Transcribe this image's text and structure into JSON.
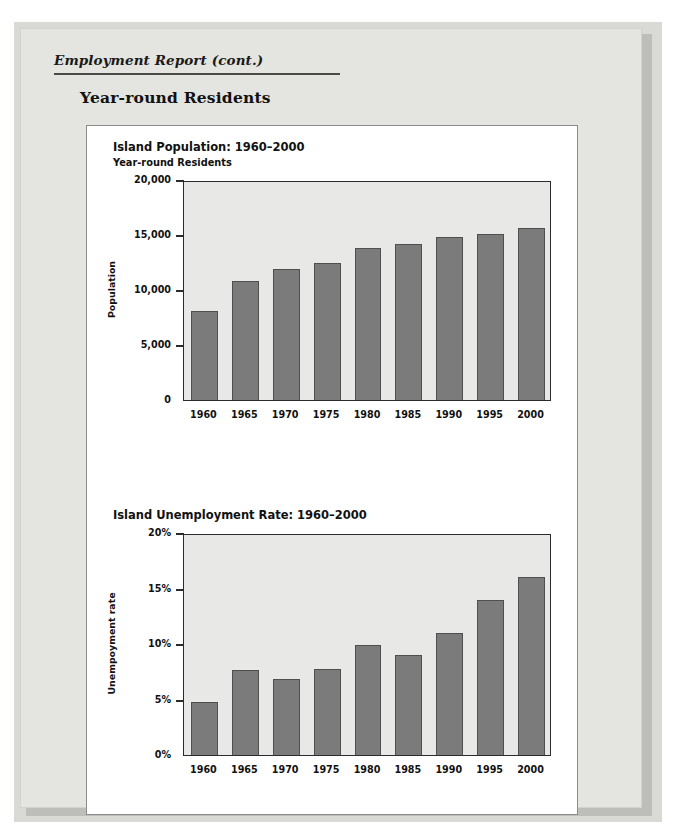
{
  "page": {
    "running_head": "Employment Report (cont.)",
    "section_heading": "Year-round Residents"
  },
  "colors": {
    "paper": "#e4e4e0",
    "figure_bg": "#ffffff",
    "plot_bg": "#e8e8e6",
    "bar_fill": "#7b7b7b",
    "bar_stroke": "#4f4f4f",
    "axis": "#2b2b2b",
    "text": "#111111"
  },
  "chart_data": [
    {
      "type": "bar",
      "title": "Island Population: 1960–2000",
      "subtitle": "Year-round Residents",
      "xlabel": "",
      "ylabel": "Population",
      "categories": [
        "1960",
        "1965",
        "1970",
        "1975",
        "1980",
        "1985",
        "1990",
        "1995",
        "2000"
      ],
      "values": [
        8300,
        11000,
        12100,
        12600,
        14000,
        14400,
        15000,
        15300,
        15800
      ],
      "ylim": [
        0,
        20000
      ],
      "yticks": [
        0,
        5000,
        10000,
        15000,
        20000
      ],
      "ytick_labels": [
        "0",
        "5,000",
        "10,000",
        "15,000",
        "20,000"
      ],
      "grid": false,
      "legend": "none"
    },
    {
      "type": "bar",
      "title": "Island Unemployment Rate: 1960–2000",
      "subtitle": "",
      "xlabel": "",
      "ylabel": "Unempoyment rate",
      "categories": [
        "1960",
        "1965",
        "1970",
        "1975",
        "1980",
        "1985",
        "1990",
        "1995",
        "2000"
      ],
      "values": [
        5.0,
        7.8,
        7.0,
        7.9,
        10.1,
        9.2,
        11.2,
        14.1,
        16.2
      ],
      "ylim": [
        0,
        20
      ],
      "yticks": [
        0,
        5,
        10,
        15,
        20
      ],
      "ytick_labels": [
        "0%",
        "5%",
        "10%",
        "15%",
        "20%"
      ],
      "grid": false,
      "legend": "none"
    }
  ]
}
